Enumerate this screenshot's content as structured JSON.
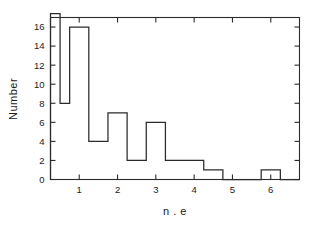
{
  "chart_data": {
    "type": "bar",
    "title": "",
    "subtitle": "",
    "xlabel": "n . e",
    "ylabel": "Number",
    "xlim": [
      0.25,
      6.75
    ],
    "ylim": [
      0,
      17
    ],
    "grid": false,
    "legend": null,
    "bin_width": 0.5,
    "histogram_style": "step-outline",
    "xticks": [
      1,
      2,
      3,
      4,
      5,
      6
    ],
    "xtick_labels": [
      "1",
      "2",
      "3",
      "4",
      "5",
      "6"
    ],
    "yticks": [
      0,
      2,
      4,
      6,
      8,
      10,
      12,
      14,
      16
    ],
    "ytick_labels": [
      "0",
      "2",
      "4",
      "6",
      "8",
      "10",
      "12",
      "14",
      "16"
    ],
    "bins": [
      {
        "x0": 0.25,
        "x1": 0.5,
        "value": 17,
        "clipped": true,
        "note": "extends above top of axis"
      },
      {
        "x0": 0.5,
        "x1": 0.75,
        "value": 8,
        "clipped": false,
        "note": ""
      },
      {
        "x0": 0.75,
        "x1": 1.25,
        "value": 16,
        "clipped": false,
        "note": ""
      },
      {
        "x0": 1.25,
        "x1": 1.75,
        "value": 4,
        "clipped": false,
        "note": ""
      },
      {
        "x0": 1.75,
        "x1": 2.25,
        "value": 7,
        "clipped": false,
        "note": ""
      },
      {
        "x0": 2.25,
        "x1": 2.75,
        "value": 2,
        "clipped": false,
        "note": ""
      },
      {
        "x0": 2.75,
        "x1": 3.25,
        "value": 6,
        "clipped": false,
        "note": ""
      },
      {
        "x0": 3.25,
        "x1": 3.75,
        "value": 2,
        "clipped": false,
        "note": ""
      },
      {
        "x0": 3.75,
        "x1": 4.25,
        "value": 2,
        "clipped": false,
        "note": ""
      },
      {
        "x0": 4.25,
        "x1": 4.75,
        "value": 1,
        "clipped": false,
        "note": ""
      },
      {
        "x0": 4.75,
        "x1": 5.75,
        "value": 0,
        "clipped": false,
        "note": ""
      },
      {
        "x0": 5.75,
        "x1": 6.25,
        "value": 1,
        "clipped": false,
        "note": ""
      },
      {
        "x0": 6.25,
        "x1": 6.75,
        "value": 0,
        "clipped": false,
        "note": ""
      }
    ],
    "categories": [
      "0.375",
      "0.625",
      "1.0",
      "1.5",
      "2.0",
      "2.5",
      "3.0",
      "3.5",
      "4.0",
      "4.5",
      "5.25",
      "6.0",
      "6.5"
    ],
    "values": [
      17,
      8,
      16,
      4,
      7,
      2,
      6,
      2,
      2,
      1,
      0,
      1,
      0
    ]
  },
  "style": {
    "line_color": "#2b2b2b",
    "axis_color": "#2b2b2b",
    "text_color": "#1a1a1a",
    "background": "#ffffff"
  }
}
